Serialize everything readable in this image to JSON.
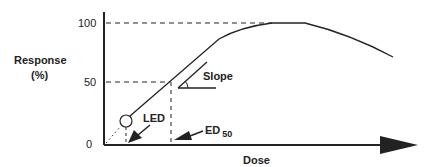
{
  "diagram": {
    "type": "dose-response curve",
    "y_axis": {
      "label_line1": "Response",
      "label_line2": "(%)",
      "ticks": [
        "100",
        "50",
        "0"
      ]
    },
    "x_axis": {
      "label": "Dose"
    },
    "annotations": {
      "slope": "Slope",
      "led": "LED",
      "ed": "ED",
      "ed_sub": "50"
    },
    "colors": {
      "line": "#222222",
      "background": "#ffffff"
    }
  }
}
